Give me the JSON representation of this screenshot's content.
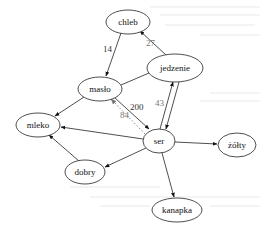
{
  "diagram": {
    "type": "directed-graph",
    "nodes": [
      {
        "id": "chleb",
        "label": "chleb",
        "cx": 128,
        "cy": 22,
        "rx": 22,
        "ry": 12
      },
      {
        "id": "jedzenie",
        "label": "jedzenie",
        "cx": 175,
        "cy": 68,
        "rx": 28,
        "ry": 14
      },
      {
        "id": "maslo",
        "label": "masło",
        "cx": 100,
        "cy": 89,
        "rx": 22,
        "ry": 12
      },
      {
        "id": "mleko",
        "label": "mleko",
        "cx": 38,
        "cy": 125,
        "rx": 22,
        "ry": 12
      },
      {
        "id": "ser",
        "label": "ser",
        "cx": 159,
        "cy": 141,
        "rx": 16,
        "ry": 12
      },
      {
        "id": "zolty",
        "label": "żółty",
        "cx": 237,
        "cy": 145,
        "rx": 19,
        "ry": 12
      },
      {
        "id": "dobry",
        "label": "dobry",
        "cx": 85,
        "cy": 172,
        "rx": 20,
        "ry": 12
      },
      {
        "id": "kanapka",
        "label": "kanapka",
        "cx": 177,
        "cy": 210,
        "rx": 25,
        "ry": 12
      }
    ],
    "edges": [
      {
        "from": "chleb",
        "to": "maslo",
        "label": "14"
      },
      {
        "from": "jedzenie",
        "to": "chleb",
        "label": "27"
      },
      {
        "from": "jedzenie",
        "to": "maslo",
        "label": ""
      },
      {
        "from": "maslo",
        "to": "ser",
        "label": "200"
      },
      {
        "from": "ser",
        "to": "maslo",
        "label": "84",
        "style": "dotted"
      },
      {
        "from": "ser",
        "to": "jedzenie",
        "label": "43"
      },
      {
        "from": "jedzenie",
        "to": "ser",
        "label": ""
      },
      {
        "from": "maslo",
        "to": "mleko",
        "label": ""
      },
      {
        "from": "ser",
        "to": "mleko",
        "label": ""
      },
      {
        "from": "dobry",
        "to": "mleko",
        "label": ""
      },
      {
        "from": "ser",
        "to": "dobry",
        "label": ""
      },
      {
        "from": "ser",
        "to": "zolty",
        "label": ""
      },
      {
        "from": "ser",
        "to": "kanapka",
        "label": ""
      }
    ]
  }
}
